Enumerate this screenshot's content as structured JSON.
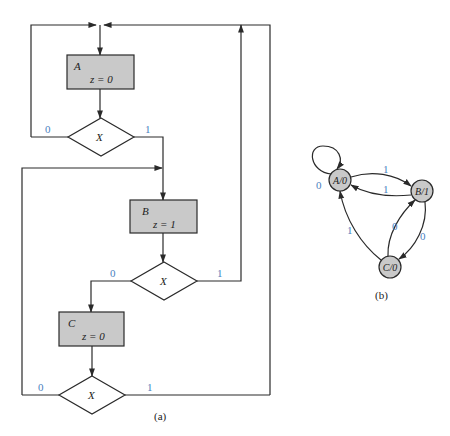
{
  "flowchart": {
    "caption": "(a)",
    "states": [
      {
        "name": "A",
        "output": "z = 0"
      },
      {
        "name": "B",
        "output": "z = 1"
      },
      {
        "name": "C",
        "output": "z = 0"
      }
    ],
    "decisions": [
      {
        "input": "X",
        "label_0": "0",
        "label_1": "1"
      },
      {
        "input": "X",
        "label_0": "0",
        "label_1": "1"
      },
      {
        "input": "X",
        "label_0": "0",
        "label_1": "1"
      }
    ]
  },
  "state_diagram": {
    "caption": "(b)",
    "nodes": [
      {
        "label": "A/0"
      },
      {
        "label": "B/1"
      },
      {
        "label": "C/0"
      }
    ],
    "edges": [
      {
        "from": "A/0",
        "to": "A/0",
        "label": "0"
      },
      {
        "from": "A/0",
        "to": "B/1",
        "label": "1"
      },
      {
        "from": "B/1",
        "to": "A/0",
        "label": "1"
      },
      {
        "from": "B/1",
        "to": "C/0",
        "label": "0"
      },
      {
        "from": "C/0",
        "to": "B/1",
        "label": "0"
      },
      {
        "from": "C/0",
        "to": "A/0",
        "label": "1"
      }
    ]
  },
  "colors": {
    "label_blue": "#4a7fc0",
    "box_fill": "#c9c9c9"
  }
}
